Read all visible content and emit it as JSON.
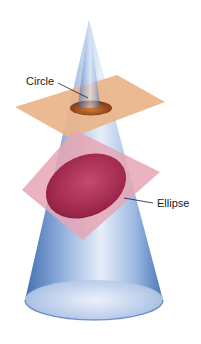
{
  "figure": {
    "type": "conic-section-diagram",
    "labels": {
      "circle": "Circle",
      "ellipse": "Ellipse"
    },
    "colors": {
      "cone": "#4a78b8",
      "cone_light": "#dfe8f6",
      "horizontal_plane": "#e9b48a",
      "tilted_plane": "#e6a6b4",
      "circle_section": "#b0521a",
      "ellipse_section": "#a0284a",
      "leader_line": "#1a1a2a"
    }
  }
}
